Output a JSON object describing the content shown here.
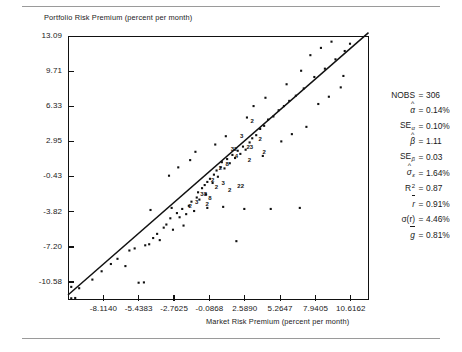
{
  "figure": {
    "y_axis_title": "Portfolio Risk Premium (percent per month)",
    "x_axis_title": "Market Risk Premium (percent per month)"
  },
  "chart_data": {
    "type": "scatter",
    "title": "",
    "xlabel": "Market Risk Premium (percent per month)",
    "ylabel": "Portfolio Risk Premium (percent per month)",
    "grid": false,
    "legend": "none",
    "xlim": [
      -10.7919,
      11.9541
    ],
    "ylim": [
      -12.27,
      13.09
    ],
    "xticks": [
      -8.114,
      -5.4383,
      -2.7625,
      -0.0868,
      2.589,
      5.2647,
      7.9405,
      10.6162
    ],
    "xtick_labels": [
      "-8.1140",
      "-5.4383",
      "-2.7625",
      "-0.0868",
      "2.5890",
      "5.2647",
      "7.9405",
      "10.6162"
    ],
    "yticks": [
      13.09,
      9.71,
      6.33,
      2.95,
      -0.43,
      -3.82,
      -7.2,
      -10.58
    ],
    "ytick_labels": [
      "13.09",
      "9.71",
      "6.33",
      "2.95",
      "-0.43",
      "-3.82",
      "-7.20",
      "-10.58"
    ],
    "n_observations": 306,
    "fit_line": {
      "intercept": 0.14,
      "slope": 1.11
    },
    "overplot_labels": "Digits mark the count of coincident observations at a plotting position",
    "points": [
      [
        -10.55,
        -12.15
      ],
      [
        -10.55,
        -11.05
      ],
      [
        -9.95,
        -11.18
      ],
      [
        -10.25,
        -12.12
      ],
      [
        -8.95,
        -10.35
      ],
      [
        -8.25,
        -9.55
      ],
      [
        -7.55,
        -8.85
      ],
      [
        -7.05,
        -8.35
      ],
      [
        -6.45,
        -9.05
      ],
      [
        -6.15,
        -7.55
      ],
      [
        -5.75,
        -7.35
      ],
      [
        -5.45,
        -10.65
      ],
      [
        -5.05,
        -10.62
      ],
      [
        -4.95,
        -7.05
      ],
      [
        -4.65,
        -6.95
      ],
      [
        -4.35,
        -6.35
      ],
      [
        -4.05,
        -5.95
      ],
      [
        -3.85,
        -6.55
      ],
      [
        -3.55,
        -5.35
      ],
      [
        -3.35,
        -5.05
      ],
      [
        -3.05,
        -4.45
      ],
      [
        -2.85,
        -5.55
      ],
      [
        -2.55,
        -3.95
      ],
      [
        -2.35,
        -4.35
      ],
      [
        -2.15,
        -3.55
      ],
      [
        -2.05,
        -5.15
      ],
      [
        -1.85,
        -4.05
      ],
      [
        -1.65,
        -3.25
      ],
      [
        -1.45,
        -2.85
      ],
      [
        -1.25,
        -3.75
      ],
      [
        -1.05,
        -2.45
      ],
      [
        -0.95,
        -1.95
      ],
      [
        -0.85,
        -2.65
      ],
      [
        -0.65,
        -1.55
      ],
      [
        -0.45,
        -1.25
      ],
      [
        -0.35,
        -2.15
      ],
      [
        -0.25,
        -0.95
      ],
      [
        -0.05,
        -0.65
      ],
      [
        0.15,
        -1.05
      ],
      [
        0.25,
        -0.25
      ],
      [
        0.45,
        0.15
      ],
      [
        0.55,
        -0.45
      ],
      [
        0.75,
        0.45
      ],
      [
        0.85,
        0.95
      ],
      [
        1.05,
        0.35
      ],
      [
        1.25,
        1.25
      ],
      [
        1.45,
        0.85
      ],
      [
        1.65,
        1.65
      ],
      [
        1.85,
        1.35
      ],
      [
        2.05,
        2.05
      ],
      [
        2.25,
        1.75
      ],
      [
        2.45,
        2.45
      ],
      [
        2.65,
        2.15
      ],
      [
        2.95,
        2.85
      ],
      [
        3.15,
        3.25
      ],
      [
        3.45,
        3.55
      ],
      [
        3.75,
        4.15
      ],
      [
        4.05,
        4.45
      ],
      [
        4.35,
        5.05
      ],
      [
        4.75,
        5.35
      ],
      [
        5.15,
        5.95
      ],
      [
        5.55,
        6.35
      ],
      [
        5.95,
        6.85
      ],
      [
        6.45,
        7.35
      ],
      [
        7.05,
        8.05
      ],
      [
        7.85,
        9.15
      ],
      [
        8.65,
        9.95
      ],
      [
        9.45,
        10.85
      ],
      [
        10.15,
        11.65
      ],
      [
        10.55,
        12.35
      ],
      [
        -1.55,
        1.15
      ],
      [
        -3.15,
        -0.35
      ],
      [
        -4.55,
        -3.65
      ],
      [
        -2.95,
        -3.45
      ],
      [
        5.35,
        2.95
      ],
      [
        6.15,
        3.65
      ],
      [
        3.95,
        1.55
      ],
      [
        7.25,
        4.35
      ],
      [
        4.55,
        -3.55
      ],
      [
        6.75,
        -3.45
      ],
      [
        1.95,
        -6.65
      ],
      [
        2.55,
        -3.55
      ],
      [
        -0.25,
        -3.45
      ],
      [
        0.95,
        -3.35
      ],
      [
        8.15,
        6.55
      ],
      [
        8.95,
        7.25
      ],
      [
        9.85,
        8.15
      ],
      [
        6.85,
        9.75
      ],
      [
        7.55,
        11.25
      ],
      [
        8.35,
        11.95
      ],
      [
        9.15,
        12.55
      ],
      [
        10.05,
        9.25
      ],
      [
        3.25,
        6.35
      ],
      [
        4.15,
        7.15
      ],
      [
        2.75,
        5.25
      ],
      [
        5.75,
        8.45
      ],
      [
        -2.45,
        0.45
      ],
      [
        -1.15,
        1.95
      ],
      [
        0.35,
        2.65
      ],
      [
        1.15,
        3.45
      ]
    ],
    "dense_labels": [
      {
        "x": 3.25,
        "y": 4.85,
        "n": "2"
      },
      {
        "x": 1.75,
        "y": 2.15,
        "n": "32"
      },
      {
        "x": 2.45,
        "y": 3.35,
        "n": "3"
      },
      {
        "x": 2.05,
        "y": 1.45,
        "n": "4"
      },
      {
        "x": 0.85,
        "y": 0.25,
        "n": "2"
      },
      {
        "x": 1.35,
        "y": 0.65,
        "n": "8"
      },
      {
        "x": 0.25,
        "y": -0.85,
        "n": "2"
      },
      {
        "x": 2.95,
        "y": 2.35,
        "n": "23"
      },
      {
        "x": 3.85,
        "y": 3.05,
        "n": "2"
      },
      {
        "x": 1.05,
        "y": -1.15,
        "n": "3"
      },
      {
        "x": 0.55,
        "y": -1.55,
        "n": "2"
      },
      {
        "x": -0.55,
        "y": -2.25,
        "n": "38"
      },
      {
        "x": 1.55,
        "y": -1.85,
        "n": "2"
      },
      {
        "x": 2.25,
        "y": -1.45,
        "n": "22"
      },
      {
        "x": -0.95,
        "y": -2.95,
        "n": "3"
      },
      {
        "x": 0.05,
        "y": -2.55,
        "n": "8"
      },
      {
        "x": -1.45,
        "y": -3.35,
        "n": "2"
      },
      {
        "x": -0.15,
        "y": -3.15,
        "n": "2"
      },
      {
        "x": 3.05,
        "y": 1.05,
        "n": "2"
      },
      {
        "x": 4.15,
        "y": 1.85,
        "n": "2"
      }
    ]
  },
  "stats_panel": {
    "rows": [
      {
        "label": "NOBS",
        "sub": "",
        "sup": "",
        "hat": "",
        "overbar": false,
        "eq": "=",
        "value": "306"
      },
      {
        "label": "α",
        "sub": "",
        "sup": "",
        "hat": "^",
        "overbar": false,
        "eq": "=",
        "value": "0.14%"
      },
      {
        "label": "SE",
        "sub": "α",
        "sup": "",
        "hat": "",
        "overbar": false,
        "eq": "=",
        "value": "0.10%"
      },
      {
        "label": "β",
        "sub": "",
        "sup": "",
        "hat": "^",
        "overbar": false,
        "eq": "=",
        "value": "1.11"
      },
      {
        "label": "SE",
        "sub": "β",
        "sup": "",
        "hat": "",
        "overbar": false,
        "eq": "=",
        "value": "0.03"
      },
      {
        "label": "σ",
        "sub": "ε",
        "sup": "",
        "hat": "^",
        "overbar": false,
        "eq": "=",
        "value": "1.64%"
      },
      {
        "label": "R",
        "sub": "",
        "sup": "2",
        "hat": "",
        "overbar": false,
        "eq": "=",
        "value": "0.87"
      },
      {
        "label": "r",
        "sub": "",
        "sup": "",
        "hat": "",
        "overbar": true,
        "eq": "=",
        "value": "0.91%"
      },
      {
        "label": "σ(r)",
        "sub": "",
        "sup": "",
        "hat": "",
        "overbar": false,
        "eq": "=",
        "value": "4.46%"
      },
      {
        "label": "g",
        "sub": "",
        "sup": "",
        "hat": "",
        "overbar": true,
        "eq": "=",
        "value": "0.81%"
      }
    ]
  }
}
